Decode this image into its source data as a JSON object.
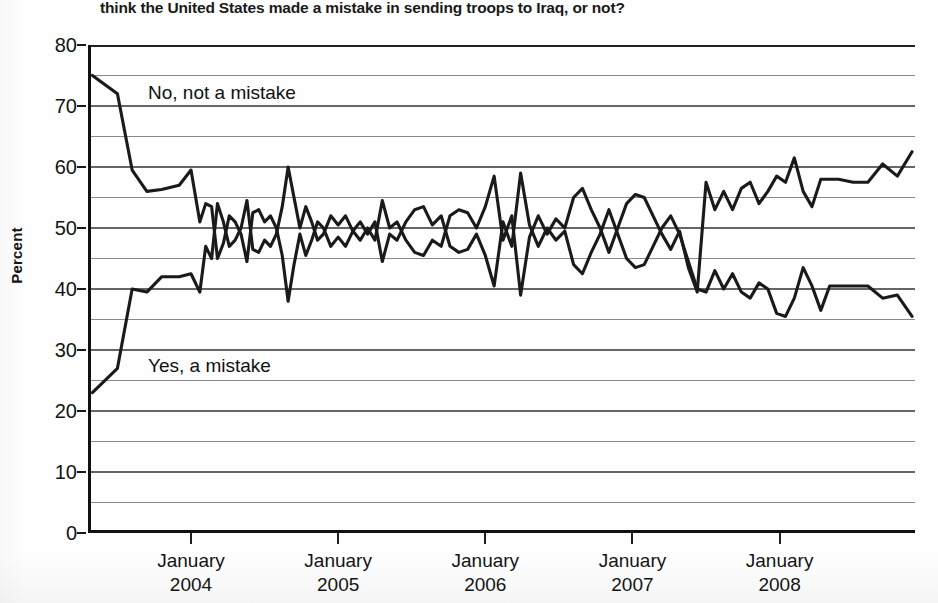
{
  "question": "think the United States made a mistake in sending troops to Iraq, or not?",
  "axis": {
    "y_title": "Percent",
    "y_ticks": [
      "0",
      "10",
      "20",
      "30",
      "40",
      "50",
      "60",
      "70",
      "80"
    ],
    "x_ticks": [
      {
        "month": "January",
        "year": "2004"
      },
      {
        "month": "January",
        "year": "2005"
      },
      {
        "month": "January",
        "year": "2006"
      },
      {
        "month": "January",
        "year": "2007"
      },
      {
        "month": "January",
        "year": "2008"
      }
    ]
  },
  "labels": {
    "no_series": "No, not a mistake",
    "yes_series": "Yes, a mistake"
  },
  "colors": {
    "line": "#1a1a1a",
    "grid_major": "#333333",
    "grid_minor": "#8a8a8a",
    "axis": "#111111",
    "background": "#fefefe"
  },
  "chart_data": {
    "type": "line",
    "title": "think the United States made a mistake in sending troops to Iraq, or not?",
    "xlabel": "",
    "ylabel": "Percent",
    "ylim": [
      0,
      80
    ],
    "xlim": [
      2003.3,
      2008.92
    ],
    "y_major_ticks": [
      0,
      10,
      20,
      30,
      40,
      50,
      60,
      70,
      80
    ],
    "y_minor_gridlines": [
      5,
      15,
      25,
      35,
      45,
      55,
      65,
      75
    ],
    "x_tick_values": [
      2004.0,
      2005.0,
      2006.0,
      2007.0,
      2008.0
    ],
    "x_tick_labels": [
      "January 2004",
      "January 2005",
      "January 2006",
      "January 2007",
      "January 2008"
    ],
    "grid": true,
    "legend": "inline-annotations",
    "series": [
      {
        "name": "No, not a mistake",
        "color": "#1a1a1a",
        "x": [
          2003.33,
          2003.5,
          2003.6,
          2003.7,
          2003.8,
          2003.92,
          2004.0,
          2004.06,
          2004.1,
          2004.14,
          2004.18,
          2004.22,
          2004.26,
          2004.3,
          2004.34,
          2004.38,
          2004.42,
          2004.46,
          2004.5,
          2004.54,
          2004.58,
          2004.62,
          2004.66,
          2004.7,
          2004.74,
          2004.78,
          2004.82,
          2004.86,
          2004.9,
          2004.95,
          2005.0,
          2005.05,
          2005.1,
          2005.15,
          2005.2,
          2005.25,
          2005.3,
          2005.35,
          2005.4,
          2005.46,
          2005.52,
          2005.58,
          2005.64,
          2005.7,
          2005.76,
          2005.82,
          2005.88,
          2005.94,
          2006.0,
          2006.06,
          2006.12,
          2006.18,
          2006.24,
          2006.3,
          2006.36,
          2006.42,
          2006.48,
          2006.54,
          2006.6,
          2006.66,
          2006.72,
          2006.78,
          2006.84,
          2006.9,
          2006.96,
          2007.02,
          2007.08,
          2007.14,
          2007.2,
          2007.26,
          2007.32,
          2007.38,
          2007.44,
          2007.5,
          2007.56,
          2007.62,
          2007.68,
          2007.74,
          2007.8,
          2007.86,
          2007.92,
          2007.98,
          2008.04,
          2008.1,
          2008.16,
          2008.22,
          2008.28,
          2008.34,
          2008.4,
          2008.5,
          2008.6,
          2008.7,
          2008.8,
          2008.9
        ],
        "y": [
          75.0,
          72.0,
          59.5,
          56.0,
          56.3,
          57.0,
          59.5,
          51.0,
          54.0,
          53.5,
          45.0,
          47.5,
          52.0,
          51.0,
          49.0,
          44.5,
          52.5,
          53.0,
          51.0,
          52.0,
          50.0,
          45.5,
          38.0,
          44.0,
          49.0,
          45.5,
          48.0,
          51.0,
          50.0,
          47.0,
          48.5,
          47.0,
          49.5,
          48.0,
          50.0,
          48.0,
          54.5,
          50.0,
          51.0,
          48.0,
          46.0,
          45.5,
          48.0,
          47.0,
          52.0,
          53.0,
          52.5,
          50.0,
          53.5,
          58.5,
          48.0,
          52.0,
          39.0,
          48.5,
          52.0,
          49.0,
          51.5,
          50.0,
          55.0,
          56.5,
          53.0,
          50.0,
          46.0,
          50.0,
          54.0,
          55.5,
          55.0,
          52.0,
          49.0,
          46.5,
          49.5,
          43.5,
          39.5,
          57.5,
          53.0,
          56.0,
          53.0,
          56.5,
          57.5,
          54.0,
          56.0,
          58.5,
          57.5,
          61.5,
          56.0,
          53.5,
          58.0,
          58.0,
          58.0,
          57.5,
          57.5,
          60.5,
          58.5,
          62.5
        ]
      },
      {
        "name": "Yes, a mistake",
        "color": "#1a1a1a",
        "x": [
          2003.33,
          2003.5,
          2003.6,
          2003.7,
          2003.8,
          2003.92,
          2004.0,
          2004.06,
          2004.1,
          2004.14,
          2004.18,
          2004.22,
          2004.26,
          2004.3,
          2004.34,
          2004.38,
          2004.42,
          2004.46,
          2004.5,
          2004.54,
          2004.58,
          2004.62,
          2004.66,
          2004.7,
          2004.74,
          2004.78,
          2004.82,
          2004.86,
          2004.9,
          2004.95,
          2005.0,
          2005.05,
          2005.1,
          2005.15,
          2005.2,
          2005.25,
          2005.3,
          2005.35,
          2005.4,
          2005.46,
          2005.52,
          2005.58,
          2005.64,
          2005.7,
          2005.76,
          2005.82,
          2005.88,
          2005.94,
          2006.0,
          2006.06,
          2006.12,
          2006.18,
          2006.24,
          2006.3,
          2006.36,
          2006.42,
          2006.48,
          2006.54,
          2006.6,
          2006.66,
          2006.72,
          2006.78,
          2006.84,
          2006.9,
          2006.96,
          2007.02,
          2007.08,
          2007.14,
          2007.2,
          2007.26,
          2007.32,
          2007.38,
          2007.44,
          2007.5,
          2007.56,
          2007.62,
          2007.68,
          2007.74,
          2007.8,
          2007.86,
          2007.92,
          2007.98,
          2008.04,
          2008.1,
          2008.16,
          2008.22,
          2008.28,
          2008.34,
          2008.4,
          2008.5,
          2008.6,
          2008.7,
          2008.8,
          2008.9
        ],
        "y": [
          23.0,
          27.0,
          40.0,
          39.5,
          42.0,
          42.0,
          42.5,
          39.5,
          47.0,
          45.0,
          54.0,
          51.0,
          47.0,
          48.0,
          50.0,
          54.5,
          46.5,
          46.0,
          48.0,
          47.0,
          49.0,
          53.5,
          60.0,
          55.0,
          50.0,
          53.5,
          51.0,
          48.0,
          49.0,
          52.0,
          50.5,
          52.0,
          49.5,
          51.0,
          49.0,
          51.0,
          44.5,
          49.0,
          48.0,
          51.0,
          53.0,
          53.5,
          50.5,
          52.0,
          47.0,
          46.0,
          46.5,
          49.0,
          45.5,
          40.5,
          51.0,
          47.0,
          59.0,
          50.5,
          47.0,
          50.0,
          48.0,
          49.5,
          44.0,
          42.5,
          46.0,
          49.0,
          53.0,
          49.0,
          45.0,
          43.5,
          44.0,
          47.0,
          50.0,
          52.0,
          49.0,
          44.5,
          40.0,
          39.5,
          43.0,
          40.0,
          42.5,
          39.5,
          38.5,
          41.0,
          40.0,
          36.0,
          35.5,
          38.5,
          43.5,
          40.5,
          36.5,
          40.5,
          40.5,
          40.5,
          40.5,
          38.5,
          39.0,
          35.5
        ]
      }
    ]
  }
}
